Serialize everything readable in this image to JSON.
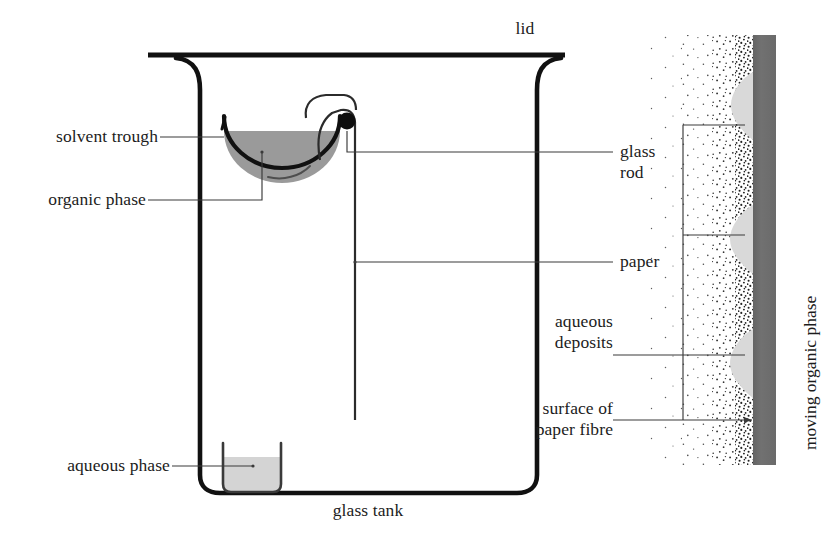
{
  "figure": {
    "type": "scientific-diagram"
  },
  "labels": {
    "lid": "lid",
    "solvent_trough": "solvent trough",
    "organic_phase": "organic phase",
    "glass_rod": "glass\nrod",
    "glass_rod_line1": "glass",
    "glass_rod_line2": "rod",
    "paper": "paper",
    "aqueous_phase": "aqueous phase",
    "glass_tank": "glass tank",
    "aqueous_deposits_line1": "aqueous",
    "aqueous_deposits_line2": "deposits",
    "surface_line1": "surface of",
    "surface_line2": "paper fibre",
    "moving_organic_phase": "moving organic phase"
  },
  "colors": {
    "ink": "#1c1c1c",
    "leader_line": "#3a3a3a",
    "tank_outline": "#111111",
    "trough_fill": "#9a9a9a",
    "trough_outline": "#111111",
    "aqueous_fill": "#d2d2d2",
    "aqueous_outline": "#3a3a3a",
    "organic_bar": "#6e6e6e",
    "deposit_fill": "#d8d8d8",
    "stipple_dot": "#2a2a2a",
    "background": "#ffffff"
  },
  "geometry": {
    "canvas": {
      "width": 830,
      "height": 545
    },
    "lid": {
      "x1": 148,
      "y": 55,
      "x2": 565,
      "thickness": 5
    },
    "tank": {
      "left": 200,
      "right": 537,
      "top": 62,
      "bottom": 493,
      "corner_radius": 18,
      "stroke": 4.5
    },
    "trough": {
      "cx": 282,
      "cy": 128,
      "rx": 58,
      "ry": 52,
      "fill_top": 131
    },
    "glass_rod": {
      "cx": 347,
      "cy": 122,
      "r": 8
    },
    "paper_strip": {
      "x": 355,
      "top": 130,
      "bottom": 420
    },
    "aqueous_beaker": {
      "x": 222,
      "y": 443,
      "width": 60,
      "height": 50,
      "liquid_top": 457
    },
    "detail_panel": {
      "stipple_left": 655,
      "stipple_right": 755,
      "stipple_top": 35,
      "stipple_bottom": 465,
      "bar_left": 753,
      "bar_right": 776,
      "bar_top": 35,
      "bar_bottom": 465,
      "deposits_y": [
        105,
        238,
        362
      ],
      "bracket_x": 683,
      "bracket_top": 125,
      "bracket_bottom": 420,
      "branch_y": [
        125,
        235,
        420
      ]
    }
  }
}
